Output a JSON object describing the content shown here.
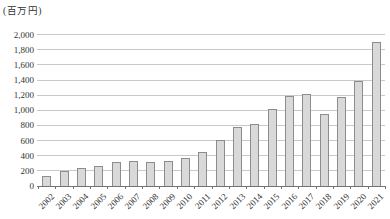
{
  "chart": {
    "background": "#ffffff",
    "bar_fill": "#d9d9d9",
    "bar_border": "#8c8c8c",
    "gridline_color": "#c9c9c9",
    "axis_color": "#737373",
    "text_color": "#333333"
  },
  "chart_data": {
    "type": "bar",
    "title": "",
    "xlabel": "",
    "ylabel": "(百万円)",
    "categories": [
      "2002",
      "2003",
      "2004",
      "2005",
      "2006",
      "2007",
      "2008",
      "2009",
      "2010",
      "2011",
      "2012",
      "2013",
      "2014",
      "2015",
      "2016",
      "2017",
      "2018",
      "2019",
      "2020",
      "2021"
    ],
    "values": [
      130,
      200,
      235,
      270,
      315,
      325,
      320,
      335,
      365,
      445,
      610,
      780,
      820,
      1020,
      1190,
      1220,
      955,
      1180,
      1390,
      1900
    ],
    "ylim": [
      0,
      2000
    ],
    "ytick_interval": 200,
    "yticks": [
      {
        "value": 0,
        "label": "0"
      },
      {
        "value": 200,
        "label": "200"
      },
      {
        "value": 400,
        "label": "400"
      },
      {
        "value": 600,
        "label": "600"
      },
      {
        "value": 800,
        "label": "800"
      },
      {
        "value": 1000,
        "label": "1,000"
      },
      {
        "value": 1200,
        "label": "1,200"
      },
      {
        "value": 1400,
        "label": "1,400"
      },
      {
        "value": 1600,
        "label": "1,600"
      },
      {
        "value": 1800,
        "label": "1,800"
      },
      {
        "value": 2000,
        "label": "2,000"
      }
    ],
    "grid": true,
    "legend": false
  }
}
